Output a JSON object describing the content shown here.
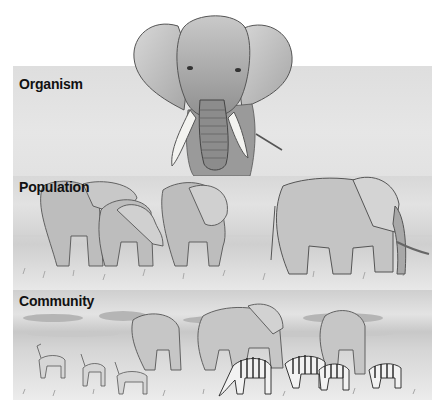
{
  "figure": {
    "panels": [
      {
        "id": "organism",
        "label": "Organism",
        "subject": "Single African elephant, front view"
      },
      {
        "id": "population",
        "label": "Population",
        "subject": "Group of African elephants on savanna"
      },
      {
        "id": "community",
        "label": "Community",
        "subject": "Elephants, zebras and gazelles on savanna"
      }
    ]
  },
  "colors": {
    "background": "#ffffff",
    "panel_gray": "#e2e2e2",
    "label_text": "#111111",
    "sketch_dark": "#555555"
  }
}
